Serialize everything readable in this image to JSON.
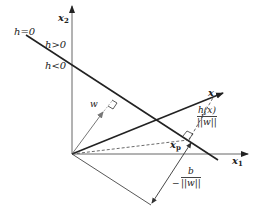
{
  "diagram": {
    "type": "linear-discriminant-geometry",
    "axes": {
      "x1_label": "x",
      "x1_sub": "1",
      "x2_label": "x",
      "x2_sub": "2"
    },
    "region_labels": {
      "boundary": "h=0",
      "positive": "h>0",
      "negative": "h<0"
    },
    "vectors": {
      "x_label": "x",
      "w_label": "w",
      "xp_label": "x",
      "xp_sub": "p",
      "r_label": "r"
    },
    "distance_fraction": {
      "numerator": "h(x)",
      "denominator": "||w||"
    },
    "offset_fraction": {
      "sign": "−",
      "numerator": "b",
      "denominator": "||w||"
    },
    "colors": {
      "line": "#222222",
      "w_vector": "#777777",
      "axes": "#555555"
    }
  }
}
